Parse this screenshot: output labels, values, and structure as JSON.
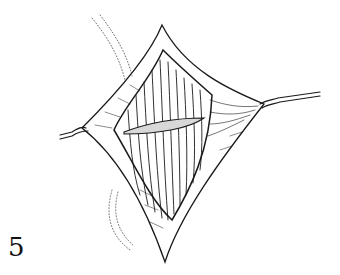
{
  "figure": {
    "number_label": "5",
    "colors": {
      "ink": "#1a1a1a",
      "background": "#ffffff"
    }
  }
}
